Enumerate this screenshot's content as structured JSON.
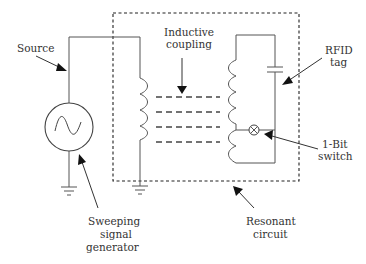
{
  "diagram": {
    "type": "RFID inductive coupling circuit",
    "labels": {
      "source": "Source",
      "inductive_coupling_line1": "Inductive",
      "inductive_coupling_line2": "coupling",
      "rfid_tag_line1": "RFID",
      "rfid_tag_line2": "tag",
      "switch_line1": "1-Bit",
      "switch_line2": "switch",
      "generator_line1": "Sweeping",
      "generator_line2": "signal",
      "generator_line3": "generator",
      "resonant_line1": "Resonant",
      "resonant_line2": "circuit"
    },
    "components": [
      {
        "id": "sweeping-signal-generator",
        "symbol": "sine-source-icon"
      },
      {
        "id": "primary-coil",
        "symbol": "inductor-icon"
      },
      {
        "id": "tag-coil",
        "symbol": "inductor-icon"
      },
      {
        "id": "tag-capacitor",
        "symbol": "capacitor-icon"
      },
      {
        "id": "one-bit-switch",
        "symbol": "crossed-circle-switch-icon"
      },
      {
        "id": "ground-generator",
        "symbol": "ground-icon"
      },
      {
        "id": "ground-primary",
        "symbol": "ground-icon"
      }
    ],
    "colors": {
      "wire": "#555555",
      "text": "#333333",
      "background": "#ffffff"
    }
  }
}
